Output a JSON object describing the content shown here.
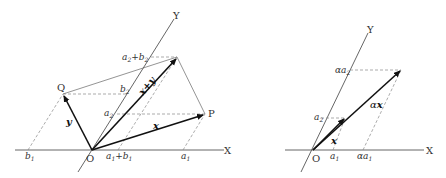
{
  "left_diagram": {
    "axes": {
      "x_label": "X",
      "y_label": "Y",
      "origin_label": "O"
    },
    "points": {
      "p_label": "P",
      "q_label": "Q"
    },
    "vectors": {
      "x": "x",
      "y": "y",
      "sum": "x+y"
    },
    "x_ticks": {
      "b1": "b",
      "b1_sub": "1",
      "a1b1_a": "a",
      "a1b1_a_sub": "1",
      "a1b1_plus": "+",
      "a1b1_b": "b",
      "a1b1_b_sub": "1",
      "a1": "a",
      "a1_sub": "1"
    },
    "y_ticks": {
      "a2": "a",
      "a2_sub": "2",
      "b2": "b",
      "b2_sub": "2",
      "a2b2_a": "a",
      "a2b2_a_sub": "2",
      "a2b2_plus": "+",
      "a2b2_b": "b",
      "a2b2_b_sub": "2"
    }
  },
  "right_diagram": {
    "axes": {
      "x_label": "X",
      "y_label": "Y",
      "origin_label": "O"
    },
    "vectors": {
      "x": "x",
      "ax_alpha": "α",
      "ax_x": "x"
    },
    "x_ticks": {
      "a1": "a",
      "a1_sub": "1",
      "aa1_alpha": "α",
      "aa1_a": "a",
      "aa1_sub": "1"
    },
    "y_ticks": {
      "a2": "a",
      "a2_sub": "2",
      "aa2_alpha": "α",
      "aa2_a": "a",
      "aa2_sub": "2"
    }
  },
  "colors": {
    "line": "#444444",
    "vector": "#111111",
    "dashed": "#888888"
  }
}
